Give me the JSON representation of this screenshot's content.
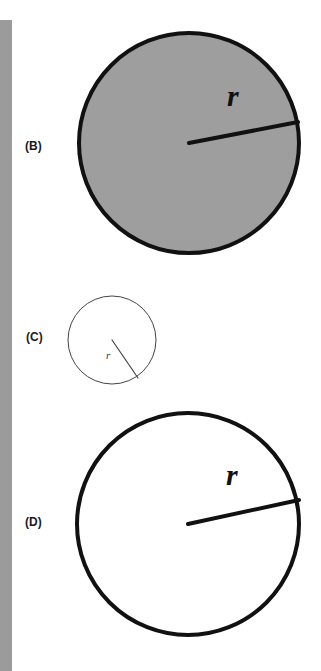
{
  "figure": {
    "background_color": "#ffffff",
    "sidebar": {
      "name": "left-margin-strip",
      "color": "#9b9b9b"
    },
    "panels": [
      {
        "id": "B",
        "label": "(B)",
        "shape": "circle",
        "fill_color": "#9e9e9e",
        "stroke_color": "#111111",
        "stroke_width": 4,
        "center": {
          "x": 119,
          "y": 125
        },
        "radius": 110,
        "radius_line": {
          "from": {
            "x": 119,
            "y": 125
          },
          "to": {
            "x": 228,
            "y": 104
          },
          "stroke_width": 4
        },
        "radius_label": "r",
        "radius_label_pos": {
          "x": 157,
          "y": 88
        },
        "radius_label_size": 30
      },
      {
        "id": "C",
        "label": "(C)",
        "shape": "circle",
        "fill_color": "#ffffff",
        "stroke_color": "#444444",
        "stroke_width": 1,
        "center": {
          "x": 50,
          "y": 49
        },
        "radius": 44,
        "radius_line": {
          "from": {
            "x": 50,
            "y": 49
          },
          "to": {
            "x": 76,
            "y": 87
          },
          "stroke_width": 1
        },
        "radius_label": "r",
        "radius_label_pos": {
          "x": 44,
          "y": 68
        },
        "radius_label_size": 11
      },
      {
        "id": "D",
        "label": "(D)",
        "shape": "circle",
        "fill_color": "#ffffff",
        "stroke_color": "#111111",
        "stroke_width": 4,
        "center": {
          "x": 120,
          "y": 121
        },
        "radius": 111,
        "radius_line": {
          "from": {
            "x": 120,
            "y": 121
          },
          "to": {
            "x": 231,
            "y": 97
          },
          "stroke_width": 4
        },
        "radius_label": "r",
        "radius_label_pos": {
          "x": 158,
          "y": 82
        },
        "radius_label_size": 30
      }
    ]
  }
}
